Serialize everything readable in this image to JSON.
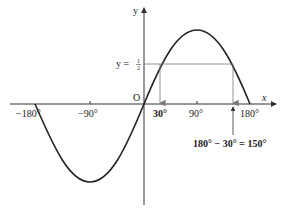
{
  "diagram": {
    "function": "y = sin x",
    "axes": {
      "x_label": "x",
      "y_label": "y",
      "origin_label": "O",
      "x_ticks": [
        "−180°",
        "−90°",
        "90°",
        "180°"
      ]
    },
    "level_line_label": "y = ",
    "level_line_fraction": {
      "numerator": "1",
      "denominator": "2"
    },
    "solutions": {
      "first_label": "30°",
      "second_label": "180° − 30° = 150°"
    },
    "colors": {
      "curve": "#222222",
      "axes": "#333333",
      "guides": "#777777"
    }
  }
}
